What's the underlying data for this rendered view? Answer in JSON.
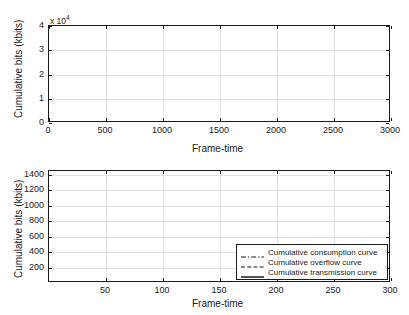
{
  "figure": {
    "background": "#ffffff",
    "curve_color": "#1a1a1a",
    "grid_color": "#e2e2e2"
  },
  "chart_data": [
    {
      "id": "top",
      "type": "line",
      "title": "",
      "xlabel": "Frame-time",
      "ylabel": "Cumulative bits (kbits)",
      "y_multiplier_label": "x 10",
      "y_multiplier_exponent": "4",
      "xlim": [
        0,
        3000
      ],
      "ylim": [
        0,
        40000
      ],
      "grid": true,
      "legend": null,
      "xticks": [
        0,
        500,
        1000,
        1500,
        2000,
        2500,
        3000
      ],
      "xticklabels": [
        "0",
        "500",
        "1000",
        "1500",
        "2000",
        "2500",
        "3000"
      ],
      "yticks": [
        0,
        10000,
        20000,
        30000,
        40000
      ],
      "yticklabels": [
        "0",
        "1",
        "2",
        "3",
        "4"
      ],
      "series": [
        {
          "name": "Cumulative transmission curve",
          "style": "solid",
          "x": [
            0,
            50,
            100,
            150,
            200,
            250,
            300,
            350,
            400,
            450,
            500,
            550,
            600,
            650,
            700,
            740,
            750,
            760,
            800,
            850,
            900,
            950,
            1000,
            1050,
            1100,
            1150,
            1200,
            1250,
            1300,
            1350,
            1400,
            1450,
            1500,
            1550,
            1600,
            1650,
            1700,
            1750,
            1800,
            1850,
            1900,
            1950,
            2000,
            2050,
            2100,
            2150,
            2200,
            2250,
            2300,
            2400,
            2500,
            2600,
            2700,
            2800,
            2900,
            3000
          ],
          "y": [
            0,
            150,
            330,
            530,
            760,
            1010,
            1270,
            1530,
            1780,
            2010,
            2210,
            2390,
            2540,
            2660,
            2760,
            2830,
            3300,
            3360,
            3500,
            3620,
            3740,
            3860,
            3990,
            4120,
            4250,
            4390,
            4560,
            4900,
            5600,
            6700,
            8100,
            9700,
            11500,
            13400,
            15300,
            17200,
            19100,
            20900,
            22500,
            24000,
            25300,
            26400,
            27400,
            28200,
            28800,
            29300,
            29650,
            29850,
            29950,
            30050,
            30100,
            30130,
            30150,
            30160,
            30170,
            30180
          ]
        }
      ]
    },
    {
      "id": "bottom",
      "type": "line",
      "title": "",
      "xlabel": "Frame-time",
      "ylabel": "Cumulative bits (kbits)",
      "xlim": [
        0,
        300
      ],
      "ylim": [
        0,
        1450
      ],
      "grid": true,
      "legend_position": "lower right",
      "xticks": [
        50,
        100,
        150,
        200,
        250,
        300
      ],
      "xticklabels": [
        "50",
        "100",
        "150",
        "200",
        "250",
        "300"
      ],
      "yticks": [
        200,
        400,
        600,
        800,
        1000,
        1200,
        1400
      ],
      "yticklabels": [
        "200",
        "400",
        "600",
        "800",
        "1000",
        "1200",
        "1400"
      ],
      "series": [
        {
          "name": "Cumulative consumption curve",
          "style": "dashdot",
          "x": [
            0,
            10,
            20,
            30,
            40,
            50,
            60,
            70,
            80,
            90,
            95,
            100,
            104,
            104,
            110,
            110,
            118,
            118,
            125,
            125,
            130,
            130,
            132,
            132,
            140,
            140,
            148,
            148,
            152,
            152,
            158,
            158,
            165,
            165,
            172,
            172,
            178,
            178,
            186,
            186,
            192,
            192,
            198,
            198,
            205,
            205,
            212,
            212,
            220,
            220,
            228,
            228,
            236,
            236,
            244,
            244,
            252,
            252,
            258,
            258,
            266,
            266,
            272,
            272,
            280,
            280,
            288,
            288,
            294,
            300
          ],
          "y": [
            20,
            24,
            28,
            32,
            36,
            40,
            44,
            48,
            52,
            58,
            62,
            70,
            70,
            160,
            160,
            175,
            175,
            195,
            195,
            330,
            330,
            345,
            345,
            430,
            430,
            445,
            445,
            455,
            455,
            540,
            540,
            555,
            555,
            570,
            570,
            585,
            585,
            640,
            640,
            790,
            790,
            800,
            800,
            870,
            870,
            885,
            885,
            960,
            960,
            980,
            980,
            1050,
            1050,
            1070,
            1070,
            1140,
            1140,
            1170,
            1170,
            1200,
            1200,
            1215,
            1215,
            1225,
            1225,
            1230,
            1230,
            1240,
            1240,
            1245
          ]
        },
        {
          "name": "Cumulative overflow curve",
          "style": "dashed",
          "x": [
            0,
            20,
            40,
            60,
            80,
            90,
            96,
            100,
            100,
            104,
            104,
            110,
            110,
            116,
            116,
            122,
            122,
            128,
            128,
            132,
            132,
            138,
            138,
            144,
            144,
            150,
            150,
            158,
            158,
            164,
            164,
            170,
            170,
            176,
            176,
            182,
            182,
            190,
            190,
            196,
            196,
            204,
            204,
            212,
            212,
            220,
            220,
            228,
            228,
            236,
            236,
            244,
            244,
            252,
            252,
            260,
            260,
            268,
            268,
            276,
            276,
            284,
            284,
            292,
            300
          ],
          "y": [
            196,
            196,
            196,
            196,
            198,
            200,
            205,
            215,
            230,
            230,
            300,
            300,
            340,
            340,
            420,
            420,
            450,
            450,
            500,
            500,
            555,
            555,
            570,
            570,
            600,
            600,
            640,
            640,
            690,
            690,
            720,
            720,
            760,
            760,
            800,
            800,
            830,
            830,
            870,
            870,
            900,
            900,
            950,
            950,
            1000,
            1000,
            1030,
            1030,
            1070,
            1070,
            1110,
            1110,
            1160,
            1160,
            1210,
            1210,
            1260,
            1260,
            1320,
            1320,
            1370,
            1370,
            1410,
            1410,
            1420
          ]
        },
        {
          "name": "Cumulative transmission curve",
          "style": "solid",
          "x": [
            0,
            20,
            40,
            60,
            80,
            90,
            100,
            110,
            120,
            130,
            140,
            150,
            160,
            170,
            180,
            190,
            200,
            210,
            220,
            230,
            240,
            250,
            260,
            270,
            280,
            290,
            300
          ],
          "y": [
            30,
            62,
            95,
            128,
            165,
            185,
            215,
            265,
            320,
            375,
            430,
            485,
            540,
            595,
            650,
            705,
            760,
            815,
            870,
            925,
            980,
            1040,
            1100,
            1160,
            1215,
            1262,
            1292
          ]
        }
      ]
    }
  ],
  "legend": {
    "entries": [
      {
        "label": "Cumulative consumption curve",
        "style": "dashdot"
      },
      {
        "label": "Cumulative overflow curve",
        "style": "dashed"
      },
      {
        "label": "Cumulative transmission curve",
        "style": "solid"
      }
    ]
  }
}
